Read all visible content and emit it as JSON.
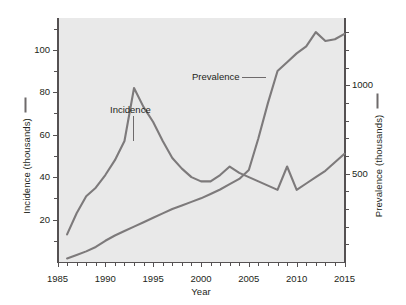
{
  "chart_data": {
    "type": "line",
    "title": "",
    "xlabel": "Year",
    "ylabel": "Incidence (thousands)",
    "y2label": "Prevalence (thousands)",
    "xlim": [
      1985,
      2015
    ],
    "ylim": [
      0,
      115
    ],
    "y2lim": [
      0,
      1380
    ],
    "grid": false,
    "legend_position": "inline-annotations",
    "x_ticks": [
      1985,
      1990,
      1995,
      2000,
      2005,
      2010,
      2015
    ],
    "x_tick_labels": [
      "1985",
      "1990",
      "1995",
      "2000",
      "2005",
      "2010",
      "2015"
    ],
    "x_minor_tick_step": 1,
    "y_ticks": [
      20,
      40,
      60,
      80,
      100
    ],
    "y_tick_labels": [
      "20",
      "40",
      "60",
      "80",
      "100"
    ],
    "y_minor_tick_step": 10,
    "y2_ticks": [
      500,
      1000
    ],
    "y2_tick_labels": [
      "500",
      "1000"
    ],
    "y2_minor_tick_step": 100,
    "annotations": [
      {
        "text": "Incidence",
        "x": 1993,
        "leader": "vertical"
      },
      {
        "text": "Prevalence",
        "x": 2007,
        "leader": "horizontal"
      }
    ],
    "series": [
      {
        "name": "Incidence",
        "axis": "left",
        "units": "thousands",
        "color": "#7d7a7b",
        "x": [
          1986,
          1987,
          1988,
          1989,
          1990,
          1991,
          1992,
          1993,
          1994,
          1995,
          1996,
          1997,
          1998,
          1999,
          2000,
          2001,
          2002,
          2003,
          2004,
          2005,
          2006,
          2007,
          2008,
          2009,
          2010,
          2011,
          2012,
          2013,
          2014,
          2015
        ],
        "values": [
          13,
          23,
          31,
          35,
          41,
          48,
          57,
          82,
          73,
          66,
          57,
          49,
          44,
          40,
          38,
          38,
          41,
          45,
          42,
          40,
          38,
          36,
          34,
          45,
          34,
          37,
          40,
          43,
          47,
          51
        ]
      },
      {
        "name": "Prevalence",
        "axis": "right",
        "units": "thousands",
        "color": "#7d7a7b",
        "x": [
          1986,
          1987,
          1988,
          1989,
          1990,
          1991,
          1992,
          1993,
          1994,
          1995,
          1996,
          1997,
          1998,
          1999,
          2000,
          2001,
          2002,
          2003,
          2004,
          2005,
          2006,
          2007,
          2008,
          2009,
          2010,
          2011,
          2012,
          2013,
          2014,
          2015
        ],
        "values": [
          20,
          40,
          60,
          85,
          120,
          150,
          175,
          200,
          225,
          250,
          275,
          300,
          320,
          340,
          360,
          385,
          410,
          440,
          470,
          520,
          700,
          900,
          1080,
          1130,
          1180,
          1220,
          1300,
          1250,
          1260,
          1290
        ]
      }
    ]
  },
  "axes": {
    "left_title": "Incidence (thousands)",
    "right_title": "Prevalence (thousands)",
    "x_title": "Year"
  },
  "labels": {
    "incidence": "Incidence",
    "prevalence": "Prevalence"
  },
  "colors": {
    "plot_background": "#e9e9e9",
    "axis": "#555152",
    "series": "#7d7a7b",
    "text": "#231f20"
  }
}
